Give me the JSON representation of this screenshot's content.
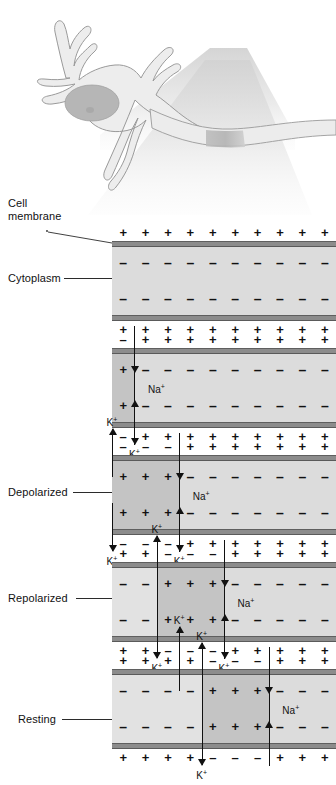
{
  "neuron": {
    "parts": [
      "dendrites",
      "cell body",
      "nucleus",
      "axon"
    ],
    "highlight_label": "axon segment magnified"
  },
  "labels": {
    "cell_membrane": "Cell\nmembrane",
    "cytoplasm": "Cytoplasm",
    "depolarized": "Depolarized",
    "repolarized": "Repolarized",
    "resting": "Resting"
  },
  "ions": {
    "sodium": "Na",
    "potassium": "K",
    "charge_sign": "+"
  },
  "charges": {
    "positive": "+",
    "negative": "–"
  },
  "colors": {
    "cytoplasm": "#dcdcdc",
    "depolarized_zone": "#c4c4c4",
    "recovered_zone": "#e2e2e2",
    "membrane": "#8c8c8c",
    "membrane_line": "#5a5a5a",
    "text": "#111111",
    "neuron_fill": "#ececec",
    "neuron_outline": "#9a9a9a",
    "nucleus": "#b4b4b4",
    "beam": "#e8e8e8"
  },
  "panels": [
    {
      "id": "panel-resting-initial",
      "label": "",
      "columns": 10,
      "outer_top": [
        "+",
        "+",
        "+",
        "+",
        "+",
        "+",
        "+",
        "+",
        "+",
        "+"
      ],
      "inner_top": [
        "–",
        "–",
        "–",
        "–",
        "–",
        "–",
        "–",
        "–",
        "–",
        "–"
      ],
      "inner_bottom": [
        "–",
        "–",
        "–",
        "–",
        "–",
        "–",
        "–",
        "–",
        "–",
        "–"
      ],
      "outer_bottom": [
        "+",
        "+",
        "+",
        "+",
        "+",
        "+",
        "+",
        "+",
        "+",
        "+"
      ],
      "zones": [],
      "boundaries": [],
      "sodium": [],
      "potassium": []
    },
    {
      "id": "panel-stimulus",
      "label": "",
      "columns": 10,
      "outer_top": [
        "–",
        "+",
        "+",
        "+",
        "+",
        "+",
        "+",
        "+",
        "+",
        "+"
      ],
      "inner_top": [
        "+",
        "–",
        "–",
        "–",
        "–",
        "–",
        "–",
        "–",
        "–",
        "–"
      ],
      "inner_bottom": [
        "+",
        "–",
        "–",
        "–",
        "–",
        "–",
        "–",
        "–",
        "–",
        "–"
      ],
      "outer_bottom": [
        "–",
        "+",
        "+",
        "+",
        "+",
        "+",
        "+",
        "+",
        "+",
        "+"
      ],
      "zones": [
        {
          "from": 0,
          "to": 1,
          "shade": "depolarized_zone"
        }
      ],
      "boundaries": [
        1
      ],
      "sodium": [
        {
          "col": 1,
          "label": "Na"
        }
      ],
      "potassium": [
        {
          "col": 1,
          "label": "K",
          "position": "below"
        }
      ]
    },
    {
      "id": "panel-depolarized",
      "label": "Depolarized",
      "columns": 10,
      "outer_top": [
        "–",
        "–",
        "–",
        "+",
        "+",
        "+",
        "+",
        "+",
        "+",
        "+"
      ],
      "inner_top": [
        "+",
        "+",
        "+",
        "–",
        "–",
        "–",
        "–",
        "–",
        "–",
        "–"
      ],
      "inner_bottom": [
        "+",
        "+",
        "+",
        "–",
        "–",
        "–",
        "–",
        "–",
        "–",
        "–"
      ],
      "outer_bottom": [
        "–",
        "–",
        "–",
        "+",
        "+",
        "+",
        "+",
        "+",
        "+",
        "+"
      ],
      "zones": [
        {
          "from": 0,
          "to": 3,
          "shade": "depolarized_zone"
        }
      ],
      "boundaries": [
        3
      ],
      "sodium": [
        {
          "col": 3,
          "label": "Na"
        }
      ],
      "potassium": [
        {
          "col": 0,
          "label": "K",
          "position": "above"
        },
        {
          "col": 0,
          "label": "K",
          "position": "below"
        },
        {
          "col": 3,
          "label": "K",
          "position": "below"
        }
      ]
    },
    {
      "id": "panel-repolarized",
      "label": "Repolarized",
      "columns": 10,
      "outer_top": [
        "+",
        "+",
        "–",
        "–",
        "–",
        "+",
        "+",
        "+",
        "+",
        "+"
      ],
      "inner_top": [
        "–",
        "–",
        "+",
        "+",
        "+",
        "–",
        "–",
        "–",
        "–",
        "–"
      ],
      "inner_bottom": [
        "–",
        "–",
        "+",
        "+",
        "+",
        "–",
        "–",
        "–",
        "–",
        "–"
      ],
      "outer_bottom": [
        "+",
        "+",
        "–",
        "–",
        "–",
        "+",
        "+",
        "+",
        "+",
        "+"
      ],
      "zones": [
        {
          "from": 0,
          "to": 2,
          "shade": "recovered_zone"
        },
        {
          "from": 2,
          "to": 5,
          "shade": "depolarized_zone"
        }
      ],
      "boundaries": [
        2,
        5
      ],
      "sodium": [
        {
          "col": 5,
          "label": "Na"
        }
      ],
      "potassium": [
        {
          "col": 2,
          "label": "K",
          "position": "above"
        },
        {
          "col": 2,
          "label": "K",
          "position": "below"
        },
        {
          "col": 5,
          "label": "K",
          "position": "below"
        }
      ]
    },
    {
      "id": "panel-resting",
      "label": "Resting",
      "columns": 10,
      "outer_top": [
        "+",
        "+",
        "+",
        "+",
        "–",
        "–",
        "–",
        "+",
        "+",
        "+"
      ],
      "inner_top": [
        "–",
        "–",
        "–",
        "–",
        "+",
        "+",
        "+",
        "–",
        "–",
        "–"
      ],
      "inner_bottom": [
        "–",
        "–",
        "–",
        "–",
        "+",
        "+",
        "+",
        "–",
        "–",
        "–"
      ],
      "outer_bottom": [
        "+",
        "+",
        "+",
        "+",
        "–",
        "–",
        "–",
        "+",
        "+",
        "+"
      ],
      "zones": [
        {
          "from": 0,
          "to": 4,
          "shade": "recovered_zone"
        },
        {
          "from": 4,
          "to": 7,
          "shade": "depolarized_zone"
        }
      ],
      "boundaries": [
        4,
        7
      ],
      "sodium": [
        {
          "col": 7,
          "label": "Na"
        }
      ],
      "potassium": [
        {
          "col": 4,
          "label": "K",
          "position": "above"
        },
        {
          "col": 4,
          "label": "K",
          "position": "below"
        },
        {
          "col": 3,
          "label": "K",
          "position": "far-above"
        }
      ]
    }
  ]
}
